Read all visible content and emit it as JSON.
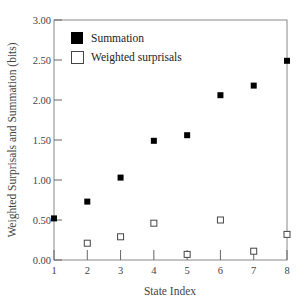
{
  "chart_data": {
    "type": "scatter",
    "title": "",
    "xlabel": "State Index",
    "ylabel": "Weighted Surprisals and Summation (bits)",
    "x": [
      1,
      2,
      3,
      4,
      5,
      6,
      7,
      8
    ],
    "xlim": [
      1,
      8
    ],
    "ylim": [
      0,
      3
    ],
    "xticks": [
      "1",
      "2",
      "3",
      "4",
      "5",
      "6",
      "7",
      "8"
    ],
    "yticks": [
      "0.00",
      "0.50",
      "1.00",
      "1.50",
      "2.00",
      "2.50",
      "3.00"
    ],
    "grid": false,
    "legend_position": "upper-left",
    "series": [
      {
        "name": "Summation",
        "marker": "filled-square",
        "color": "#000000",
        "x": [
          1,
          2,
          3,
          4,
          5,
          6,
          7,
          8
        ],
        "values": [
          0.52,
          0.73,
          1.03,
          1.49,
          1.56,
          2.06,
          2.18,
          2.49
        ]
      },
      {
        "name": "Weighted surprisals",
        "marker": "open-square",
        "color": "#000000",
        "x": [
          2,
          3,
          4,
          5,
          6,
          7,
          8
        ],
        "values": [
          0.21,
          0.29,
          0.46,
          0.07,
          0.5,
          0.11,
          0.32
        ]
      }
    ]
  },
  "legend": {
    "items": [
      {
        "label": "Summation"
      },
      {
        "label": "Weighted surprisals"
      }
    ]
  }
}
